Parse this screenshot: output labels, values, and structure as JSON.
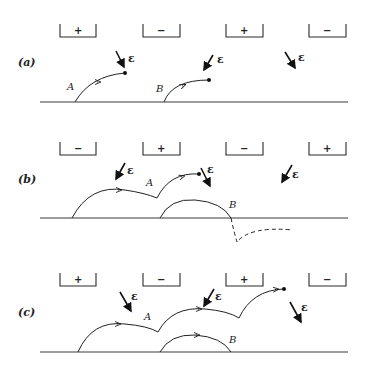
{
  "figure": {
    "field_symbol": "ε",
    "panels": [
      {
        "id": "a",
        "label": "(a)",
        "plates": [
          "+",
          "−",
          "+",
          "−"
        ],
        "points": {
          "A": "A",
          "B": "B"
        },
        "field_arrows": [
          "down-right",
          "down-left",
          "down-right"
        ]
      },
      {
        "id": "b",
        "label": "(b)",
        "plates": [
          "−",
          "+",
          "−",
          "+"
        ],
        "points": {
          "A": "A",
          "B": "B"
        },
        "field_arrows": [
          "down-left",
          "down-right",
          "down-left"
        ]
      },
      {
        "id": "c",
        "label": "(c)",
        "plates": [
          "+",
          "−",
          "+",
          "−"
        ],
        "points": {
          "A": "A",
          "B": "B"
        },
        "field_arrows": [
          "down-right",
          "down-left",
          "down-right"
        ]
      }
    ]
  }
}
